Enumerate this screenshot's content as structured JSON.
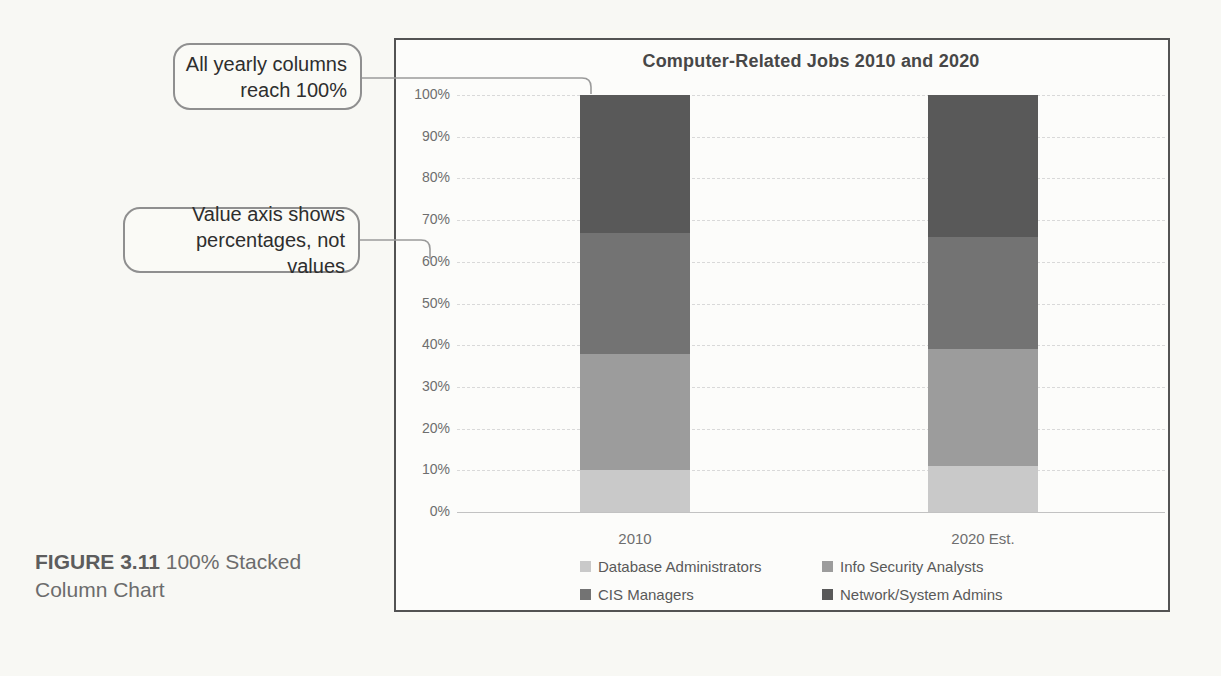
{
  "callouts": [
    {
      "lines": [
        "All yearly columns",
        "reach 100%"
      ]
    },
    {
      "lines": [
        "Value axis shows",
        "percentages, not values"
      ]
    }
  ],
  "figure_caption": {
    "label": "FIGURE 3.11",
    "text": "100% Stacked Column Chart"
  },
  "chart_data": {
    "type": "bar",
    "subtype": "100-percent-stacked-column",
    "title": "Computer-Related Jobs 2010 and 2020",
    "categories": [
      "2010",
      "2020 Est."
    ],
    "series": [
      {
        "name": "Database Administrators",
        "color": "#c9c9c9",
        "values": [
          10,
          11
        ]
      },
      {
        "name": "Info Security Analysts",
        "color": "#9c9c9c",
        "values": [
          28,
          28
        ]
      },
      {
        "name": "CIS Managers",
        "color": "#737373",
        "values": [
          29,
          27
        ]
      },
      {
        "name": "Network/System Admins",
        "color": "#595959",
        "values": [
          33,
          34
        ]
      }
    ],
    "unit": "percent",
    "ylim": [
      0,
      100
    ],
    "y_ticks": [
      "0%",
      "10%",
      "20%",
      "30%",
      "40%",
      "50%",
      "60%",
      "70%",
      "80%",
      "90%",
      "100%"
    ],
    "grid": true,
    "legend_position": "bottom",
    "legend_rows": 2
  }
}
